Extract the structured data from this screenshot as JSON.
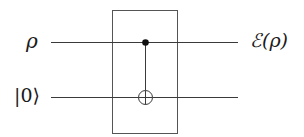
{
  "diagram": {
    "type": "quantum-circuit",
    "wires": [
      {
        "id": "q0",
        "input_label": "ρ",
        "output_label": "ℰ(ρ)",
        "y": 42
      },
      {
        "id": "q1",
        "input_label": "|0⟩",
        "output_label": "",
        "y": 97
      }
    ],
    "wire_x_start": 51,
    "wire_x_end": 238,
    "gates": [
      {
        "type": "CNOT",
        "control_wire": "q0",
        "target_wire": "q1",
        "x": 145
      }
    ],
    "channel_box": {
      "x": 112,
      "y": 10,
      "width": 65,
      "height": 123,
      "label": ""
    },
    "colors": {
      "line": "#3a3a3a",
      "box": "#555555",
      "text": "#1a1a1a",
      "background": "#ffffff"
    }
  }
}
